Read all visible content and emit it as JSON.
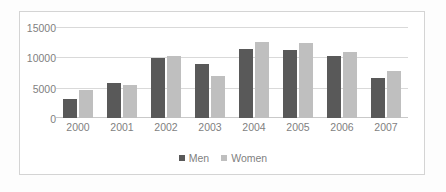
{
  "chart_data": {
    "type": "bar",
    "title": "",
    "subtitle": "",
    "xlabel": "",
    "ylabel": "",
    "categories": [
      "2000",
      "2001",
      "2002",
      "2003",
      "2004",
      "2005",
      "2006",
      "2007"
    ],
    "series": [
      {
        "name": "Men",
        "color": "#595959",
        "values": [
          3100,
          5700,
          9900,
          8900,
          11300,
          11200,
          10200,
          6600
        ]
      },
      {
        "name": "Women",
        "color": "#bfbfbf",
        "values": [
          4700,
          5500,
          10200,
          7000,
          12500,
          12400,
          10900,
          7800
        ]
      }
    ],
    "ylim": [
      0,
      15000
    ],
    "yticks": [
      "0",
      "5000",
      "10000",
      "15000"
    ],
    "ytick_values": [
      0,
      5000,
      10000,
      15000
    ],
    "grid": true,
    "legend_position": "bottom"
  },
  "legend": {
    "entries": [
      {
        "label": "Men",
        "swatch": "legend-swatch-men"
      },
      {
        "label": "Women",
        "swatch": "legend-swatch-women"
      }
    ]
  },
  "colors": {
    "men": "#595959",
    "women": "#bfbfbf",
    "gridline": "#d9d9d9",
    "tick_text": "#7f7f7f",
    "frame": "#d4d4d4",
    "background": "#ffffff"
  }
}
